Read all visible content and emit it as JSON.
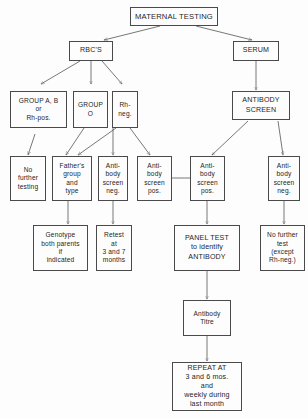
{
  "diagram": {
    "title_box": "MATERNAL TESTING",
    "nodes": {
      "maternal_testing": "MATERNAL TESTING",
      "rbcs": "RBC'S",
      "serum": "SERUM",
      "group_ab": "GROUP A, B\nor\nRh-pos.",
      "group_o": "GROUP\nO",
      "rh_neg": "Rh-\nneg.",
      "antibody_screen": "ANTIBODY\nSCREEN",
      "no_further_testing": "No\nfurther\ntesting",
      "fathers_group": "Father's\ngroup\nand\ntype",
      "ab_screen_neg_1": "Anti-\nbody\nscreen\nneg.",
      "ab_screen_pos_1": "Anti-\nbody\nscreen\npos.",
      "ab_screen_pos_2": "Anti-\nbody\nscreen\npos.",
      "ab_screen_neg_2": "Anti-\nbody\nscreen\nneg.",
      "genotype": "Genotype\nboth parents\nif\nindicated",
      "retest": "Retest\nat\n3 and 7\nmonths",
      "panel_test": "PANEL TEST\nto identify\nANTIBODY",
      "no_further_test_except": "No further\ntest\n(except\nRh-neg.)",
      "antibody_titre": "Antibody\nTitre",
      "repeat_at": "REPEAT AT\n3 and 6 mos.\nand\nweekly during\nlast month"
    },
    "colors": {
      "border": "#4a4a4a",
      "text": "#1d1d1d",
      "arrow": "#555555",
      "background": "#fdfdfd"
    }
  }
}
